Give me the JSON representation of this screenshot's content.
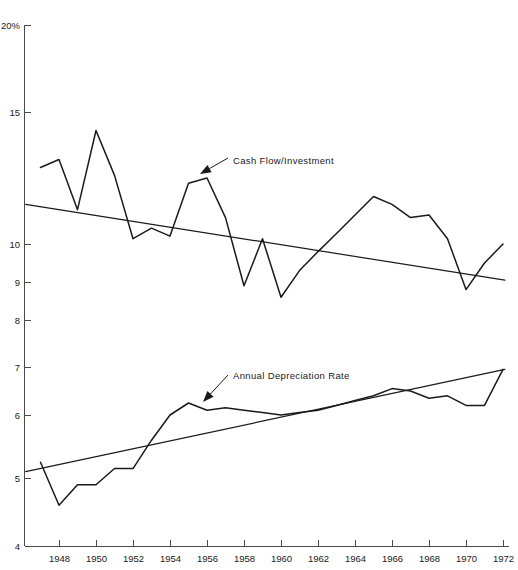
{
  "chart_data": {
    "type": "line",
    "title": "",
    "subtitle": "",
    "xlabel": "",
    "ylabel": "",
    "grid": false,
    "legend_position": "inline-annotations",
    "x": [
      1947,
      1948,
      1949,
      1950,
      1951,
      1952,
      1953,
      1954,
      1955,
      1956,
      1957,
      1958,
      1959,
      1960,
      1961,
      1962,
      1963,
      1964,
      1965,
      1966,
      1967,
      1968,
      1969,
      1970,
      1971,
      1972
    ],
    "xtick_labels": [
      "1948",
      "1950",
      "1952",
      "1954",
      "1956",
      "1958",
      "1960",
      "1962",
      "1964",
      "1966",
      "1968",
      "1970",
      "1972"
    ],
    "xtick_values": [
      1948,
      1950,
      1952,
      1954,
      1956,
      1958,
      1960,
      1962,
      1964,
      1966,
      1968,
      1970,
      1972
    ],
    "xlim": [
      1946.2,
      1972.1
    ],
    "ytick_labels": [
      "20%",
      "15",
      "10",
      "9",
      "8",
      "7",
      "6",
      "5",
      "4"
    ],
    "ytick_values": [
      20,
      15,
      10,
      9,
      8,
      7,
      6,
      5,
      4
    ],
    "ylim": [
      4,
      20
    ],
    "y_scale": "non-linear-compressed-upper",
    "series": [
      {
        "name": "Cash Flow/Investment",
        "unit": "percent",
        "values": [
          12.9,
          13.2,
          11.3,
          14.3,
          12.6,
          10.2,
          10.6,
          10.3,
          12.3,
          12.5,
          11.0,
          8.9,
          10.2,
          8.6,
          9.3,
          9.8,
          10.4,
          11.1,
          11.8,
          11.5,
          11.0,
          11.1,
          10.2,
          8.8,
          9.5,
          10.0
        ]
      },
      {
        "name": "Annual Depreciation Rate",
        "unit": "percent",
        "values": [
          5.25,
          4.6,
          4.9,
          4.9,
          5.15,
          5.15,
          5.6,
          6.0,
          6.25,
          6.1,
          6.15,
          6.1,
          6.05,
          6.0,
          6.05,
          6.1,
          6.2,
          6.3,
          6.4,
          6.55,
          6.5,
          6.35,
          6.4,
          6.2,
          6.2,
          6.95
        ]
      }
    ],
    "trend_lines": [
      {
        "name": "Cash Flow/Investment trend",
        "x_start": 1946.2,
        "y_start": 11.5,
        "x_end": 1972.1,
        "y_end": 9.05
      },
      {
        "name": "Annual Depreciation Rate trend",
        "x_start": 1946.2,
        "y_start": 5.1,
        "x_end": 1972.1,
        "y_end": 6.95
      }
    ],
    "annotations": [
      {
        "id": "cash-flow-annotation",
        "label": "Cash Flow/Investment",
        "text_x": 233,
        "text_y": 164,
        "leader_from_x": 228,
        "leader_from_y": 158,
        "arrow_tip_x": 200,
        "arrow_tip_y": 174
      },
      {
        "id": "depreciation-annotation",
        "label": "Annual Depreciation Rate",
        "text_x": 233,
        "text_y": 379,
        "leader_from_x": 228,
        "leader_from_y": 375,
        "arrow_tip_x": 203,
        "arrow_tip_y": 402
      }
    ]
  },
  "axes": {
    "y_axis_name": "y-axis",
    "x_axis_name": "x-axis"
  }
}
